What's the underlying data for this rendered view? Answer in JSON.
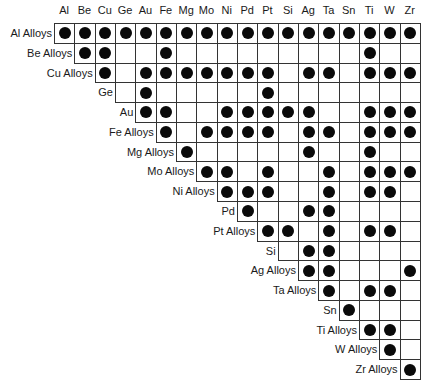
{
  "chart_data": {
    "type": "table",
    "title": "",
    "columns": [
      "Al",
      "Be",
      "Cu",
      "Ge",
      "Au",
      "Fe",
      "Mg",
      "Mo",
      "Ni",
      "Pd",
      "Pt",
      "Si",
      "Ag",
      "Ta",
      "Sn",
      "Ti",
      "W",
      "Zr"
    ],
    "rows": [
      {
        "label": "Al Alloys",
        "start": 0,
        "marks": [
          1,
          1,
          1,
          1,
          1,
          1,
          1,
          1,
          1,
          1,
          1,
          1,
          1,
          1,
          1,
          1,
          1,
          1
        ]
      },
      {
        "label": "Be Alloys",
        "start": 1,
        "marks": [
          1,
          1,
          0,
          0,
          1,
          0,
          0,
          0,
          0,
          0,
          0,
          0,
          0,
          0,
          1,
          0,
          0
        ]
      },
      {
        "label": "Cu Alloys",
        "start": 2,
        "marks": [
          1,
          0,
          1,
          1,
          1,
          1,
          1,
          1,
          1,
          0,
          1,
          1,
          0,
          1,
          1,
          1
        ]
      },
      {
        "label": "Ge",
        "start": 3,
        "marks": [
          0,
          1,
          0,
          0,
          0,
          0,
          0,
          1,
          0,
          0,
          0,
          0,
          0,
          0,
          0
        ]
      },
      {
        "label": "Au",
        "start": 4,
        "marks": [
          1,
          1,
          0,
          0,
          1,
          1,
          1,
          1,
          1,
          0,
          0,
          1,
          1,
          1
        ]
      },
      {
        "label": "Fe Alloys",
        "start": 5,
        "marks": [
          1,
          0,
          1,
          1,
          1,
          1,
          0,
          1,
          1,
          0,
          1,
          1,
          1
        ]
      },
      {
        "label": "Mg Alloys",
        "start": 6,
        "marks": [
          1,
          0,
          0,
          0,
          0,
          0,
          1,
          0,
          0,
          1,
          0,
          0
        ]
      },
      {
        "label": "Mo Alloys",
        "start": 7,
        "marks": [
          1,
          1,
          0,
          1,
          0,
          0,
          1,
          0,
          1,
          1,
          1
        ]
      },
      {
        "label": "Ni Alloys",
        "start": 8,
        "marks": [
          1,
          1,
          1,
          0,
          0,
          1,
          0,
          1,
          1,
          0
        ]
      },
      {
        "label": "Pd",
        "start": 9,
        "marks": [
          1,
          0,
          0,
          1,
          1,
          0,
          0,
          0,
          0
        ]
      },
      {
        "label": "Pt Alloys",
        "start": 10,
        "marks": [
          1,
          1,
          0,
          1,
          0,
          1,
          1,
          0
        ]
      },
      {
        "label": "Si",
        "start": 11,
        "marks": [
          0,
          1,
          1,
          0,
          0,
          0,
          0
        ]
      },
      {
        "label": "Ag Alloys",
        "start": 12,
        "marks": [
          1,
          1,
          0,
          0,
          0,
          1
        ]
      },
      {
        "label": "Ta Alloys",
        "start": 13,
        "marks": [
          1,
          0,
          1,
          1,
          0
        ]
      },
      {
        "label": "Sn",
        "start": 14,
        "marks": [
          1,
          0,
          0,
          0
        ]
      },
      {
        "label": "Ti Alloys",
        "start": 15,
        "marks": [
          1,
          1,
          0
        ]
      },
      {
        "label": "W Alloys",
        "start": 16,
        "marks": [
          1,
          0
        ]
      },
      {
        "label": "Zr Alloys",
        "start": 17,
        "marks": [
          1
        ]
      }
    ]
  },
  "layout": {
    "left": 54,
    "top": 23,
    "cell_w": 20.33,
    "cell_h": 19.78
  },
  "icons": {
    "mark": "filled-circle-dot"
  }
}
